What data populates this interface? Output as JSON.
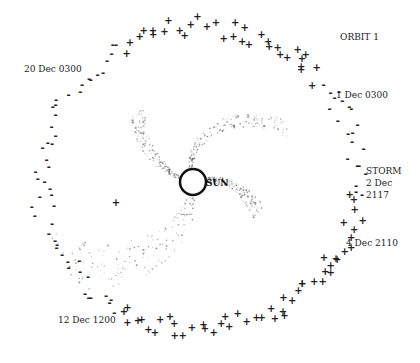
{
  "diagram": {
    "center_label": "SUN",
    "orbit_label": "ORBIT 1",
    "date_labels": [
      {
        "id": "dec1",
        "text": "1 Dec 0300"
      },
      {
        "id": "storm",
        "text": "STORM"
      },
      {
        "id": "dec2",
        "text": "2 Dec"
      },
      {
        "id": "dec2t",
        "text": "2117"
      },
      {
        "id": "dec4",
        "text": "4 Dec 2110"
      },
      {
        "id": "dec12",
        "text": "12 Dec 1200"
      },
      {
        "id": "dec20",
        "text": "20 Dec 0300"
      }
    ],
    "polarity_symbols": {
      "positive": "+",
      "negative": "-"
    },
    "sectors": [
      {
        "from_deg": -120,
        "to_deg": -40,
        "polarity": "+"
      },
      {
        "from_deg": -40,
        "to_deg": 5,
        "polarity": "-"
      },
      {
        "from_deg": 5,
        "to_deg": 120,
        "polarity": "+"
      },
      {
        "from_deg": 120,
        "to_deg": 240,
        "polarity": "-"
      }
    ]
  }
}
